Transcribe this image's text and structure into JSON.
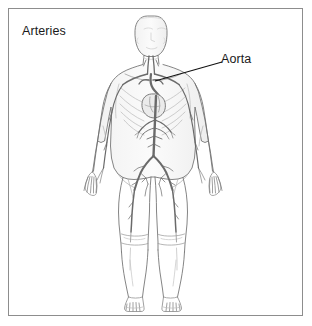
{
  "figure": {
    "title": "Arteries",
    "border_color": "#8d8d8d",
    "background_color": "#ffffff",
    "text_color": "#1a1a1a",
    "width": 312,
    "height": 326
  },
  "callouts": [
    {
      "label": "Aorta",
      "leader_line": {
        "from_x": 222,
        "from_y": 62,
        "to_x": 155,
        "to_y": 81,
        "color": "#111111"
      }
    }
  ],
  "illustration": {
    "name": "human-arterial-system-anterior-view",
    "description": "Anterior view of a full human body outline showing the arterial system, with the heart and aorta highlighted in the chest and the arterial tree branching to head, arms, abdomen and legs.",
    "outline_color": "#6f6f6f",
    "vessel_color": "#7a7a7a",
    "shading_color": "#d9d9d9",
    "parts": [
      "head",
      "neck",
      "shoulders",
      "ribcage",
      "heart",
      "aortic-arch",
      "descending-aorta",
      "arms",
      "hands",
      "abdominal-arteries",
      "iliac-bifurcation",
      "pelvis",
      "thighs",
      "knees",
      "lower-legs",
      "feet"
    ]
  }
}
